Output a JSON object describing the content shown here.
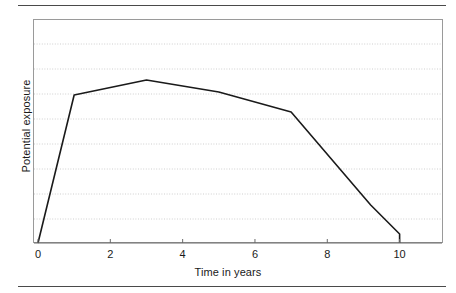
{
  "figure": {
    "background_color": "#ffffff",
    "rule_color": "#4a4a4a",
    "frame_color": "#9a9a9a",
    "gridline_color": "#cfcfcf",
    "series_color": "#1a1a1a"
  },
  "chart_data": {
    "type": "line",
    "title": "",
    "subtitle": "",
    "xlabel": "Time in years",
    "ylabel": "Potential exposure",
    "xlim": [
      0,
      11.2
    ],
    "ylim": [
      0,
      8.96
    ],
    "xticks": [
      0,
      2,
      4,
      6,
      8,
      10
    ],
    "xtick_labels": [
      "0",
      "2",
      "4",
      "6",
      "8",
      "10"
    ],
    "yticks": [],
    "ytick_labels": [],
    "grid": {
      "horizontal": true,
      "vertical": false,
      "style": "dotted",
      "count": 8,
      "values": [
        0.96,
        1.96,
        2.96,
        3.96,
        4.96,
        5.96,
        6.96,
        7.96
      ]
    },
    "legend": {
      "visible": false,
      "position": "none"
    },
    "series": [
      {
        "name": "Potential exposure",
        "x": [
          0,
          1,
          3,
          5,
          7,
          9.2,
          10,
          10
        ],
        "values": [
          0,
          5.92,
          6.52,
          6.04,
          5.24,
          1.52,
          0.36,
          0
        ],
        "marker": "none",
        "linewidth": 1.6
      }
    ],
    "annotations": []
  }
}
